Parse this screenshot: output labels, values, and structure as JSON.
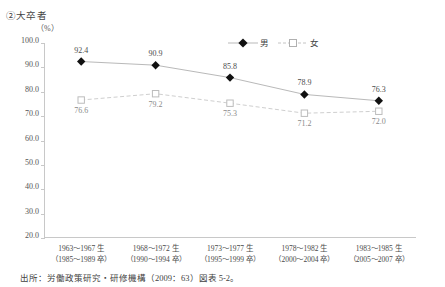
{
  "chart_data": {
    "type": "line",
    "title": "②大卒者",
    "subtitle": "",
    "unit_label": "（%）",
    "xlabel": "",
    "ylabel": "",
    "ylim": [
      20.0,
      100.0
    ],
    "ytick_step": 10.0,
    "ytick_labels": [
      "100.0",
      "90.0",
      "80.0",
      "70.0",
      "60.0",
      "50.0",
      "40.0",
      "30.0",
      "20.0"
    ],
    "ytick_values": [
      100.0,
      90.0,
      80.0,
      70.0,
      60.0,
      50.0,
      40.0,
      30.0,
      20.0
    ],
    "grid": false,
    "legend_position": "top-right",
    "categories": [
      "1963～1967 生",
      "1968～1972 生",
      "1973～1977 生",
      "1978～1982 生",
      "1983～1985 生"
    ],
    "categories_line2": [
      "（1985～1989 卒）",
      "（1990～1994 卒）",
      "（1995～1999 卒）",
      "（2000～2004 卒）",
      "（2005～2007 卒）"
    ],
    "series": [
      {
        "name": "男",
        "marker": "filled-diamond",
        "line_style": "solid",
        "color": "#000000",
        "line_color": "#b9b9b9",
        "values": [
          92.4,
          90.9,
          85.8,
          78.9,
          76.3
        ],
        "labels": [
          "92.4",
          "90.9",
          "85.8",
          "78.9",
          "76.3"
        ]
      },
      {
        "name": "女",
        "marker": "open-square",
        "line_style": "dashed",
        "color": "#ffffff",
        "line_color": "#cfcfcf",
        "values": [
          76.6,
          79.2,
          75.3,
          71.2,
          72.0
        ],
        "labels": [
          "76.6",
          "79.2",
          "75.3",
          "71.2",
          "72.0"
        ]
      }
    ],
    "annotations": []
  },
  "source": {
    "note": "出所：労働政策研究・研修機構（2009：63）図表 5‐2。"
  }
}
